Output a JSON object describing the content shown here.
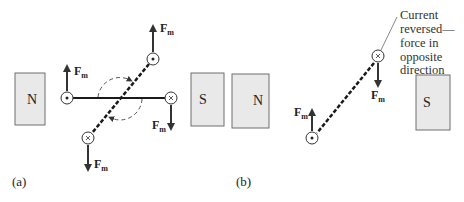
{
  "panel_a": {
    "label": "(a)",
    "magnet_north": "N",
    "magnet_south": "S",
    "forces": [
      {
        "id": "left",
        "symbol": "F",
        "sub": "m",
        "direction": "up",
        "current": "out (dot)"
      },
      {
        "id": "top",
        "symbol": "F",
        "sub": "m",
        "direction": "up",
        "current": "out (dot)"
      },
      {
        "id": "right",
        "symbol": "F",
        "sub": "m",
        "direction": "down",
        "current": "in (cross)"
      },
      {
        "id": "bottom",
        "symbol": "F",
        "sub": "m",
        "direction": "down",
        "current": "in (cross)"
      }
    ],
    "rotation": "clockwise (dashed arcs)"
  },
  "panel_b": {
    "label": "(b)",
    "magnet_north": "N",
    "magnet_south": "S",
    "forces": [
      {
        "id": "upper",
        "symbol": "F",
        "sub": "m",
        "direction": "down",
        "current": "in (cross)"
      },
      {
        "id": "lower",
        "symbol": "F",
        "sub": "m",
        "direction": "up",
        "current": "out (dot)"
      }
    ],
    "annotation": [
      "Current",
      "reversed—",
      "force in",
      "opposite",
      "direction"
    ]
  },
  "colors": {
    "magnet_fill": "#e9e9e9",
    "magnet_stroke": "#6f6f6f",
    "arrow": "#333333",
    "wire": "#1a1a1a"
  }
}
